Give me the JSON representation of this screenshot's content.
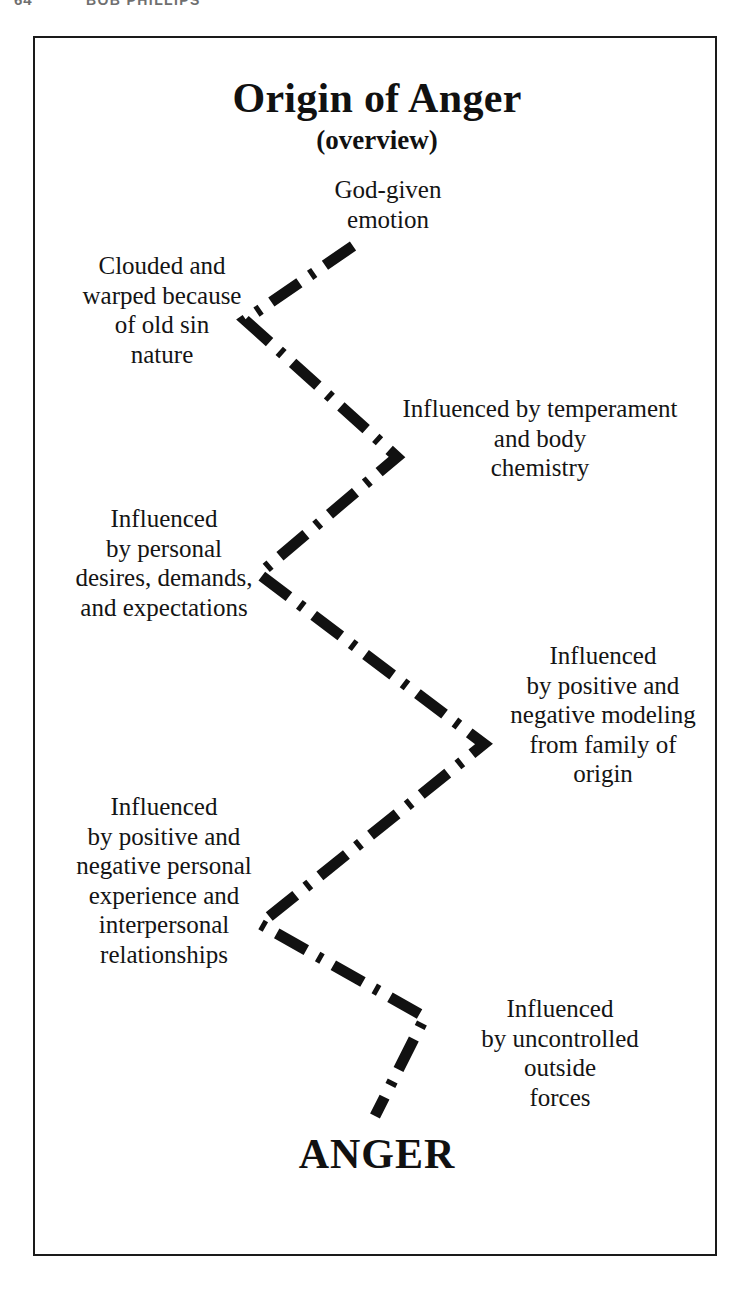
{
  "page_header": {
    "folio": "64",
    "running_title": "BOB PHILLIPS"
  },
  "figure": {
    "title": "Origin of Anger",
    "subtitle": "(overview)",
    "outcome_label": "ANGER",
    "line_style": "dash-dot",
    "line_color": "#111111",
    "frame_color": "#1a1a1a",
    "nodes": [
      {
        "id": "god-given",
        "text": "God-given\nemotion",
        "side": "right",
        "order": 1
      },
      {
        "id": "clouded",
        "text": "Clouded and\nwarped because\nof old sin\nnature",
        "side": "left",
        "order": 2
      },
      {
        "id": "temperament",
        "text": "Influenced by temperament\nand body\nchemistry",
        "side": "right",
        "order": 3
      },
      {
        "id": "desires",
        "text": "Influenced\nby personal\ndesires, demands,\nand expectations",
        "side": "left",
        "order": 4
      },
      {
        "id": "modeling",
        "text": "Influenced\nby positive and\nnegative modeling\nfrom family of\norigin",
        "side": "right",
        "order": 5
      },
      {
        "id": "experience",
        "text": "Influenced\nby positive and\nnegative personal\nexperience and\ninterpersonal\nrelationships",
        "side": "left",
        "order": 6
      },
      {
        "id": "outside-forces",
        "text": "Influenced\nby uncontrolled\noutside\nforces",
        "side": "right",
        "order": 7
      }
    ],
    "polyline_points": "318,208 210,282 362,419 224,536 449,706 225,886 390,979 340,1078"
  }
}
